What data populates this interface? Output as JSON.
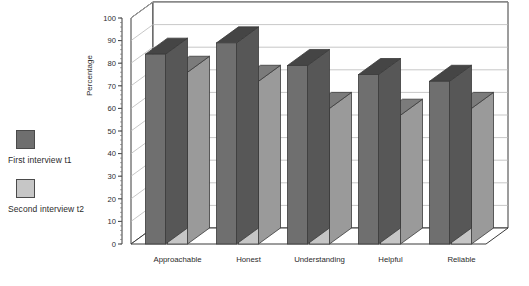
{
  "chart_data": {
    "type": "bar",
    "title": "",
    "subtitle": "",
    "xlabel": "",
    "ylabel": "Percentage",
    "ylim": [
      0,
      100
    ],
    "ytick_step": 10,
    "yticks": [
      0,
      10,
      20,
      30,
      40,
      50,
      60,
      70,
      80,
      90,
      100
    ],
    "grid": true,
    "three_d": true,
    "legend_position": "left",
    "categories": [
      "Approachable",
      "Honest",
      "Understanding",
      "Helpful",
      "Reliable"
    ],
    "series": [
      {
        "name": "First interview t1",
        "color": "#6f6f6f",
        "values": [
          84,
          89,
          79,
          75,
          72
        ]
      },
      {
        "name": "Second interview t2",
        "color": "#c6c6c6",
        "values": [
          76,
          72,
          60,
          57,
          60
        ]
      }
    ]
  },
  "legend": {
    "items": [
      {
        "label": "First interview t1",
        "swatch": "dark-gray-swatch-icon"
      },
      {
        "label": "Second interview t2",
        "swatch": "light-gray-swatch-icon"
      }
    ]
  },
  "axis": {
    "y_title": "Percentage"
  }
}
